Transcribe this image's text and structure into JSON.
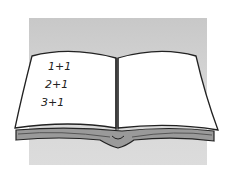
{
  "illustration": {
    "subject": "open book",
    "left_page_lines": [
      "1+1",
      "2+1",
      "3+1"
    ],
    "colors": {
      "background": "#ffffff",
      "backdrop": "#d2d2d2",
      "page": "#ffffff",
      "ink": "#222222",
      "page_edges": "#8a8a8a"
    }
  }
}
